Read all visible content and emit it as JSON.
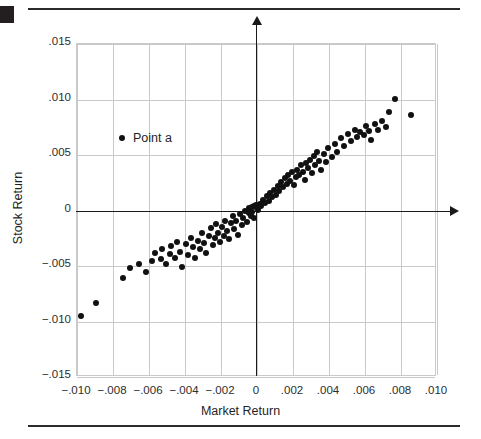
{
  "figure": {
    "corner_mark": "black-square",
    "legend": {
      "label": "Point a",
      "marker": "filled-circle"
    }
  },
  "chart_data": {
    "type": "scatter",
    "title": "",
    "xlabel": "Market Return",
    "ylabel": "Stock Return",
    "xlim": [
      -0.01,
      0.01
    ],
    "ylim": [
      -0.015,
      0.015
    ],
    "xticks": [
      -0.01,
      -0.008,
      -0.006,
      -0.004,
      -0.002,
      0,
      0.002,
      0.004,
      0.006,
      0.008,
      0.01
    ],
    "xticklabels": [
      "−.010",
      "−.008",
      "−.006",
      "−.004",
      "−.002",
      "0",
      ".002",
      ".004",
      ".006",
      ".008",
      ".010"
    ],
    "yticks": [
      0.015,
      0.01,
      0.005,
      0,
      -0.005,
      -0.01,
      -0.015
    ],
    "yticklabels": [
      ".015",
      ".010",
      ".005",
      "0",
      "−.005",
      "−.010",
      "−.015"
    ],
    "grid": true,
    "legend_position": "upper-left-inside",
    "series": [
      {
        "name": "Point a",
        "marker": "filled-circle",
        "color": "#111111",
        "points": [
          [
            -0.0097,
            -0.0096
          ],
          [
            -0.0089,
            -0.0084
          ],
          [
            -0.0074,
            -0.0062
          ],
          [
            -0.007,
            -0.0053
          ],
          [
            -0.0065,
            -0.0049
          ],
          [
            -0.0061,
            -0.0056
          ],
          [
            -0.0058,
            -0.0046
          ],
          [
            -0.0056,
            -0.0039
          ],
          [
            -0.0053,
            -0.0045
          ],
          [
            -0.0052,
            -0.0036
          ],
          [
            -0.005,
            -0.0049
          ],
          [
            -0.0048,
            -0.004
          ],
          [
            -0.0047,
            -0.0033
          ],
          [
            -0.0045,
            -0.0044
          ],
          [
            -0.0044,
            -0.0029
          ],
          [
            -0.0042,
            -0.0038
          ],
          [
            -0.0041,
            -0.0052
          ],
          [
            -0.0039,
            -0.0031
          ],
          [
            -0.0038,
            -0.0041
          ],
          [
            -0.0036,
            -0.0026
          ],
          [
            -0.0035,
            -0.0034
          ],
          [
            -0.0034,
            -0.0044
          ],
          [
            -0.0032,
            -0.0028
          ],
          [
            -0.0031,
            -0.0036
          ],
          [
            -0.003,
            -0.0021
          ],
          [
            -0.0029,
            -0.003
          ],
          [
            -0.0028,
            -0.0039
          ],
          [
            -0.0026,
            -0.0024
          ],
          [
            -0.0025,
            -0.0017
          ],
          [
            -0.0024,
            -0.0032
          ],
          [
            -0.0023,
            -0.0026
          ],
          [
            -0.0022,
            -0.0013
          ],
          [
            -0.0021,
            -0.0021
          ],
          [
            -0.002,
            -0.0029
          ],
          [
            -0.0019,
            -0.0016
          ],
          [
            -0.0018,
            -0.0024
          ],
          [
            -0.0017,
            -0.001
          ],
          [
            -0.0016,
            -0.0019
          ],
          [
            -0.0015,
            -0.0027
          ],
          [
            -0.0014,
            -0.0012
          ],
          [
            -0.0013,
            -0.0006
          ],
          [
            -0.0012,
            -0.0018
          ],
          [
            -0.0011,
            -0.001
          ],
          [
            -0.001,
            -0.0023
          ],
          [
            -0.0009,
            -0.0004
          ],
          [
            -0.0008,
            -0.0014
          ],
          [
            -0.0007,
            -0.0008
          ],
          [
            -0.0006,
            -0.0001
          ],
          [
            -0.0005,
            -0.0011
          ],
          [
            -0.0004,
            -0.0003
          ],
          [
            -0.0004,
            0.0001
          ],
          [
            -0.0003,
            -0.0006
          ],
          [
            -0.0002,
            0.0002
          ],
          [
            -0.0002,
            -0.0002
          ],
          [
            -0.0001,
            0.0003
          ],
          [
            -0.0001,
            -0.0008
          ],
          [
            0.0,
            0.0002
          ],
          [
            0.0,
            0.0004
          ],
          [
            0.0001,
            0.0
          ],
          [
            0.0002,
            0.0005
          ],
          [
            0.0003,
            0.0003
          ],
          [
            0.0004,
            0.0009
          ],
          [
            0.0005,
            0.0006
          ],
          [
            0.0006,
            0.0012
          ],
          [
            0.0007,
            0.0008
          ],
          [
            0.0008,
            0.0015
          ],
          [
            0.0009,
            0.0011
          ],
          [
            0.001,
            0.0018
          ],
          [
            0.0011,
            0.0013
          ],
          [
            0.0012,
            0.0021
          ],
          [
            0.0013,
            0.0017
          ],
          [
            0.0014,
            0.0025
          ],
          [
            0.0015,
            0.002
          ],
          [
            0.0016,
            0.0028
          ],
          [
            0.0017,
            0.0023
          ],
          [
            0.0018,
            0.0031
          ],
          [
            0.0019,
            0.0026
          ],
          [
            0.002,
            0.0034
          ],
          [
            0.0021,
            0.0022
          ],
          [
            0.0022,
            0.0029
          ],
          [
            0.0023,
            0.0036
          ],
          [
            0.0024,
            0.0031
          ],
          [
            0.0025,
            0.004
          ],
          [
            0.0026,
            0.0034
          ],
          [
            0.0027,
            0.0027
          ],
          [
            0.0028,
            0.0042
          ],
          [
            0.0029,
            0.0037
          ],
          [
            0.003,
            0.0045
          ],
          [
            0.0031,
            0.0033
          ],
          [
            0.0032,
            0.0048
          ],
          [
            0.0033,
            0.004
          ],
          [
            0.0034,
            0.0052
          ],
          [
            0.0035,
            0.0044
          ],
          [
            0.0036,
            0.0036
          ],
          [
            0.0038,
            0.005
          ],
          [
            0.0039,
            0.0043
          ],
          [
            0.004,
            0.0055
          ],
          [
            0.0042,
            0.0047
          ],
          [
            0.0044,
            0.0059
          ],
          [
            0.0045,
            0.0052
          ],
          [
            0.0047,
            0.0064
          ],
          [
            0.0049,
            0.0057
          ],
          [
            0.0051,
            0.0068
          ],
          [
            0.0053,
            0.0062
          ],
          [
            0.0055,
            0.0072
          ],
          [
            0.0056,
            0.0065
          ],
          [
            0.0058,
            0.007
          ],
          [
            0.006,
            0.0067
          ],
          [
            0.0061,
            0.0075
          ],
          [
            0.0063,
            0.0071
          ],
          [
            0.0064,
            0.0063
          ],
          [
            0.0066,
            0.0077
          ],
          [
            0.0068,
            0.0072
          ],
          [
            0.007,
            0.008
          ],
          [
            0.0072,
            0.0074
          ],
          [
            0.0074,
            0.0088
          ],
          [
            0.0077,
            0.01
          ],
          [
            0.0086,
            0.0085
          ]
        ]
      }
    ]
  }
}
